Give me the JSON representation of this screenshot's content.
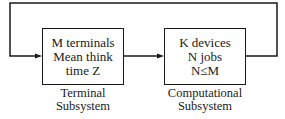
{
  "diagram": {
    "terminal_box": {
      "lines": [
        "M terminals",
        "Mean think",
        "time Z"
      ],
      "caption": [
        "Terminal",
        "Subsystem"
      ]
    },
    "computational_box": {
      "lines": [
        "K devices",
        "N jobs",
        "N≤M"
      ],
      "caption": [
        "Computational",
        "Subsystem"
      ]
    },
    "edges": [
      {
        "from": "terminal_box",
        "to": "computational_box",
        "type": "arrow"
      },
      {
        "from": "computational_box",
        "to": "terminal_box",
        "type": "feedback-loop-arrow"
      }
    ]
  }
}
